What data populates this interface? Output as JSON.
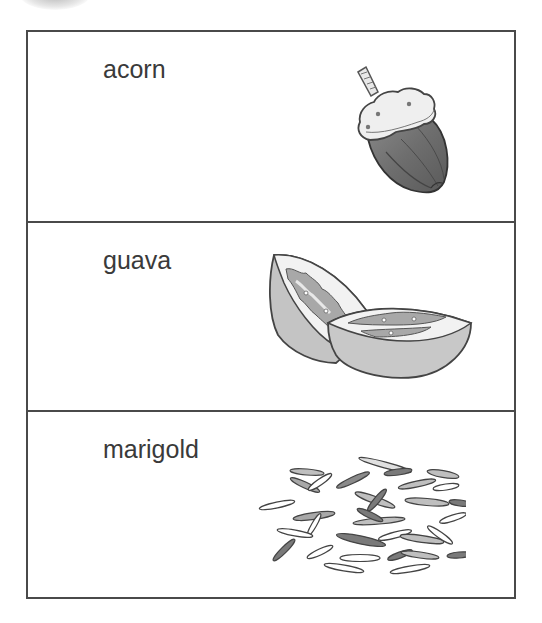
{
  "rows": [
    {
      "label": "acorn",
      "picture": "acorn-illustration"
    },
    {
      "label": "guava",
      "picture": "guava-halves-illustration"
    },
    {
      "label": "marigold",
      "picture": "marigold-seeds-illustration"
    }
  ],
  "colors": {
    "border": "#4a4a4a",
    "text": "#3a3a3a",
    "background": "#ffffff"
  }
}
